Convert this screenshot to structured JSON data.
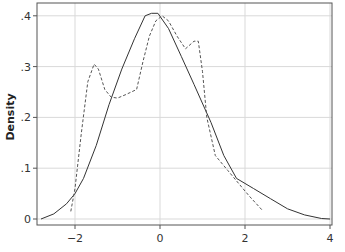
{
  "chart_data": {
    "type": "line",
    "title": "",
    "xlabel": "",
    "ylabel": "Density",
    "xlim": [
      -3.0,
      4.05
    ],
    "ylim": [
      0,
      0.42
    ],
    "x_ticks": [
      -2,
      0,
      2,
      4
    ],
    "x_tick_labels": [
      "−2",
      "0",
      "2",
      "4"
    ],
    "y_ticks": [
      0,
      0.1,
      0.2,
      0.3,
      0.4
    ],
    "y_tick_labels": [
      "0",
      ".1",
      ".2",
      ".3",
      ".4"
    ],
    "grid": true,
    "legend": null,
    "series": [
      {
        "name": "normal density",
        "style": "solid",
        "color": "#333333",
        "x": [
          -2.8,
          -2.5,
          -2.2,
          -2.0,
          -1.8,
          -1.5,
          -1.2,
          -0.9,
          -0.6,
          -0.35,
          -0.2,
          -0.05,
          0.2,
          0.5,
          0.8,
          1.2,
          1.5,
          1.8,
          2.2,
          2.6,
          3.0,
          3.4,
          3.8,
          4.0
        ],
        "y": [
          0.0,
          0.01,
          0.03,
          0.05,
          0.08,
          0.145,
          0.225,
          0.295,
          0.355,
          0.4,
          0.405,
          0.405,
          0.375,
          0.32,
          0.265,
          0.19,
          0.125,
          0.08,
          0.06,
          0.04,
          0.02,
          0.008,
          0.001,
          0.0
        ]
      },
      {
        "name": "kernel density",
        "style": "dashed",
        "color": "#555555",
        "x": [
          -2.1,
          -2.0,
          -1.85,
          -1.7,
          -1.55,
          -1.45,
          -1.3,
          -1.15,
          -1.0,
          -0.8,
          -0.55,
          -0.4,
          -0.25,
          -0.1,
          0.05,
          0.2,
          0.4,
          0.6,
          0.8,
          0.9,
          1.0,
          1.1,
          1.3,
          1.6,
          1.9,
          2.1,
          2.4
        ],
        "y": [
          0.015,
          0.06,
          0.17,
          0.27,
          0.305,
          0.295,
          0.255,
          0.24,
          0.238,
          0.245,
          0.255,
          0.31,
          0.36,
          0.39,
          0.4,
          0.39,
          0.36,
          0.335,
          0.35,
          0.35,
          0.29,
          0.2,
          0.125,
          0.095,
          0.065,
          0.045,
          0.018
        ]
      }
    ]
  },
  "plot": {
    "x_pixel_origin": 160,
    "x_pixel_per_unit": 42.5,
    "y_pixel_origin": 219,
    "y_pixel_per_unit": 508,
    "frame": {
      "left": 37,
      "top": 3,
      "right": 332,
      "bottom": 225
    }
  }
}
